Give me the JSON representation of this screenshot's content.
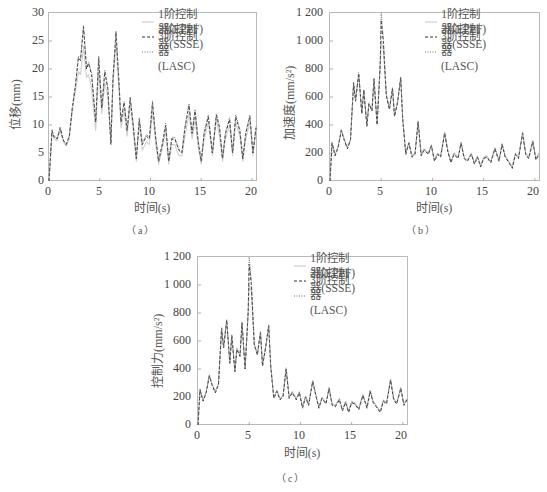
{
  "legend": [
    {
      "label": "1阶控制器(EPPF)",
      "style": "solid",
      "color": "#cfcfcf"
    },
    {
      "label": "3阶控制器(SSSE)",
      "style": "dashed",
      "color": "#333333"
    },
    {
      "label": "3阶控制器(LASC)",
      "style": "dotted",
      "color": "#777777"
    }
  ],
  "panels": {
    "a": {
      "caption": "（a）",
      "ylabel": "位移(mm)",
      "xlabel": "时间(s)",
      "yticks": [
        "0",
        "5",
        "10",
        "15",
        "20",
        "25",
        "30"
      ],
      "xticks": [
        "0",
        "5",
        "10",
        "15",
        "20"
      ]
    },
    "b": {
      "caption": "（b）",
      "ylabel": "加速度(mm/s²)",
      "xlabel": "时间(s)",
      "yticks": [
        "0",
        "200",
        "400",
        "600",
        "800",
        "1 000",
        "1 200"
      ],
      "xticks": [
        "0",
        "5",
        "10",
        "15",
        "20"
      ]
    },
    "c": {
      "caption": "（c）",
      "ylabel": "控制力(mm/s²)",
      "xlabel": "时间(s)",
      "yticks": [
        "0",
        "200",
        "400",
        "600",
        "800",
        "1 000",
        "1 200"
      ],
      "xticks": [
        "0",
        "5",
        "10",
        "15",
        "20"
      ]
    }
  },
  "chart_data": [
    {
      "type": "line",
      "title": "(a)",
      "xlabel": "时间(s)",
      "ylabel": "位移(mm)",
      "xlim": [
        0,
        20.5
      ],
      "ylim": [
        0,
        30
      ],
      "grid": false,
      "legend_position": "upper right",
      "x": [
        0,
        0.3,
        0.5,
        0.8,
        1.1,
        1.4,
        1.7,
        2.0,
        2.3,
        2.6,
        2.9,
        3.1,
        3.4,
        3.7,
        3.9,
        4.2,
        4.6,
        4.9,
        5.2,
        5.5,
        5.8,
        6.1,
        6.3,
        6.6,
        6.9,
        7.1,
        7.4,
        7.7,
        8.0,
        8.3,
        8.6,
        8.9,
        9.2,
        9.6,
        9.9,
        10.2,
        10.5,
        10.8,
        11.2,
        11.5,
        11.8,
        12.1,
        12.4,
        12.8,
        13.1,
        13.4,
        13.8,
        14.1,
        14.4,
        14.7,
        15.0,
        15.3,
        15.7,
        16.1,
        16.5,
        16.8,
        17.1,
        17.4,
        17.8,
        18.1,
        18.4,
        18.8,
        19.1,
        19.4,
        19.8,
        20.1,
        20.4
      ],
      "series": [
        {
          "name": "1阶控制器(EPPF)",
          "values": [
            0,
            8.5,
            7.5,
            7.2,
            9.0,
            7.0,
            6.2,
            7.5,
            12.5,
            16.0,
            19.5,
            19.0,
            24.0,
            18.5,
            19.0,
            16.5,
            9.0,
            19.5,
            12.0,
            17.5,
            15.0,
            7.0,
            17.0,
            24.5,
            16.0,
            9.5,
            12.5,
            8.0,
            13.5,
            9.0,
            3.5,
            10.0,
            5.5,
            7.0,
            6.5,
            12.5,
            7.0,
            3.0,
            6.0,
            9.0,
            3.0,
            6.5,
            6.5,
            4.5,
            4.5,
            8.0,
            12.0,
            7.5,
            11.0,
            6.0,
            3.0,
            7.5,
            10.5,
            4.5,
            11.0,
            8.0,
            3.5,
            7.5,
            10.0,
            4.5,
            10.5,
            8.0,
            3.5,
            7.5,
            10.5,
            4.5,
            9.0
          ]
        },
        {
          "name": "3阶控制器(SSSE)",
          "values": [
            0,
            9.0,
            7.8,
            7.5,
            9.5,
            7.3,
            6.5,
            8.0,
            13.0,
            17.0,
            22.0,
            21.5,
            27.5,
            20.0,
            21.0,
            19.0,
            10.5,
            22.0,
            13.0,
            19.5,
            16.5,
            6.5,
            18.0,
            26.5,
            17.5,
            10.5,
            14.0,
            9.0,
            14.8,
            10.0,
            4.0,
            11.0,
            6.5,
            8.0,
            7.5,
            14.0,
            8.0,
            3.5,
            6.8,
            10.0,
            3.5,
            7.5,
            7.5,
            5.5,
            5.0,
            9.5,
            13.5,
            8.5,
            12.5,
            7.0,
            3.5,
            8.5,
            11.5,
            5.0,
            11.8,
            9.5,
            4.0,
            8.5,
            11.0,
            5.0,
            11.5,
            9.0,
            4.0,
            8.5,
            11.5,
            5.0,
            9.5
          ]
        },
        {
          "name": "3阶控制器(LASC)",
          "values": [
            0,
            9.2,
            8.0,
            7.7,
            9.6,
            7.5,
            6.6,
            8.2,
            13.2,
            17.2,
            22.3,
            21.8,
            27.8,
            20.5,
            21.2,
            19.3,
            10.8,
            22.3,
            13.3,
            19.8,
            16.8,
            6.7,
            18.3,
            26.8,
            17.8,
            10.8,
            14.2,
            9.2,
            15.0,
            10.3,
            4.2,
            11.3,
            6.8,
            8.3,
            7.8,
            14.3,
            8.3,
            3.7,
            7.0,
            10.3,
            3.7,
            7.8,
            7.8,
            5.7,
            5.2,
            9.8,
            13.8,
            8.8,
            12.8,
            7.3,
            3.7,
            8.8,
            11.8,
            5.2,
            12.0,
            9.8,
            4.2,
            8.8,
            11.3,
            5.2,
            11.8,
            9.3,
            4.2,
            8.8,
            11.8,
            5.2,
            9.7
          ]
        }
      ]
    },
    {
      "type": "line",
      "title": "(b)",
      "xlabel": "时间(s)",
      "ylabel": "加速度(mm/s²)",
      "xlim": [
        0,
        20.5
      ],
      "ylim": [
        0,
        1200
      ],
      "grid": false,
      "legend_position": "upper right",
      "x": [
        0,
        0.2,
        0.5,
        0.8,
        1.1,
        1.4,
        1.7,
        2.0,
        2.3,
        2.5,
        2.8,
        3.1,
        3.3,
        3.6,
        3.8,
        4.1,
        4.3,
        4.6,
        4.9,
        5.0,
        5.2,
        5.5,
        5.8,
        6.1,
        6.3,
        6.6,
        6.9,
        7.1,
        7.4,
        7.7,
        8.0,
        8.3,
        8.6,
        8.9,
        9.2,
        9.6,
        9.9,
        10.2,
        10.5,
        10.8,
        11.2,
        11.5,
        11.8,
        12.1,
        12.5,
        12.8,
        13.1,
        13.4,
        13.8,
        14.1,
        14.4,
        14.7,
        15.0,
        15.3,
        15.7,
        16.1,
        16.5,
        16.8,
        17.1,
        17.4,
        17.8,
        18.1,
        18.4,
        18.8,
        19.1,
        19.4,
        19.8,
        20.1,
        20.4
      ],
      "series": [
        {
          "name": "1阶控制器(EPPF)",
          "values": [
            0,
            280,
            190,
            250,
            370,
            300,
            240,
            300,
            690,
            580,
            760,
            490,
            640,
            400,
            560,
            510,
            720,
            410,
            820,
            1000,
            940,
            620,
            520,
            670,
            470,
            570,
            730,
            450,
            200,
            280,
            180,
            200,
            430,
            190,
            230,
            200,
            260,
            150,
            200,
            180,
            350,
            220,
            140,
            200,
            170,
            280,
            170,
            150,
            200,
            130,
            180,
            110,
            170,
            180,
            140,
            240,
            150,
            270,
            180,
            150,
            100,
            200,
            170,
            350,
            200,
            170,
            290,
            160,
            200
          ]
        },
        {
          "name": "3阶控制器(SSSE)",
          "values": [
            0,
            270,
            180,
            240,
            360,
            290,
            230,
            290,
            700,
            570,
            770,
            480,
            650,
            390,
            550,
            500,
            730,
            400,
            830,
            1150,
            1000,
            610,
            510,
            660,
            460,
            560,
            740,
            440,
            190,
            270,
            170,
            190,
            420,
            180,
            220,
            190,
            250,
            140,
            190,
            170,
            340,
            210,
            130,
            190,
            160,
            270,
            160,
            140,
            190,
            120,
            170,
            100,
            160,
            170,
            130,
            230,
            140,
            260,
            170,
            140,
            90,
            190,
            160,
            340,
            190,
            160,
            280,
            150,
            190
          ]
        },
        {
          "name": "3阶控制器(LASC)",
          "values": [
            0,
            275,
            185,
            245,
            365,
            295,
            235,
            295,
            705,
            575,
            775,
            485,
            655,
            395,
            555,
            505,
            735,
            405,
            835,
            1200,
            1020,
            615,
            515,
            665,
            465,
            565,
            745,
            445,
            195,
            275,
            175,
            195,
            425,
            185,
            225,
            195,
            255,
            145,
            195,
            175,
            345,
            215,
            135,
            195,
            165,
            275,
            165,
            145,
            195,
            125,
            175,
            105,
            165,
            175,
            135,
            235,
            145,
            265,
            175,
            145,
            95,
            195,
            165,
            345,
            195,
            165,
            285,
            155,
            195
          ]
        }
      ]
    },
    {
      "type": "line",
      "title": "(c)",
      "xlabel": "时间(s)",
      "ylabel": "控制力(mm/s²)",
      "xlim": [
        0,
        20.5
      ],
      "ylim": [
        0,
        1200
      ],
      "grid": false,
      "legend_position": "upper right",
      "x": [
        0,
        0.2,
        0.5,
        0.8,
        1.1,
        1.4,
        1.7,
        2.0,
        2.3,
        2.5,
        2.8,
        3.1,
        3.3,
        3.6,
        3.8,
        4.1,
        4.3,
        4.6,
        4.9,
        5.0,
        5.2,
        5.5,
        5.8,
        6.1,
        6.3,
        6.6,
        6.9,
        7.1,
        7.4,
        7.7,
        8.0,
        8.3,
        8.6,
        8.9,
        9.2,
        9.6,
        9.9,
        10.2,
        10.5,
        10.8,
        11.2,
        11.5,
        11.8,
        12.1,
        12.5,
        12.8,
        13.1,
        13.4,
        13.8,
        14.1,
        14.4,
        14.7,
        15.0,
        15.3,
        15.7,
        16.1,
        16.5,
        16.8,
        17.1,
        17.4,
        17.8,
        18.1,
        18.4,
        18.8,
        19.1,
        19.4,
        19.8,
        20.1,
        20.4
      ],
      "series": [
        {
          "name": "1阶控制器(EPPF)",
          "values": [
            0,
            260,
            180,
            240,
            360,
            290,
            240,
            300,
            680,
            560,
            740,
            450,
            630,
            390,
            550,
            500,
            720,
            410,
            800,
            1000,
            950,
            580,
            510,
            670,
            430,
            560,
            700,
            430,
            200,
            250,
            190,
            210,
            410,
            200,
            240,
            190,
            240,
            130,
            210,
            150,
            320,
            220,
            130,
            200,
            160,
            270,
            150,
            140,
            190,
            110,
            170,
            100,
            170,
            160,
            120,
            220,
            130,
            250,
            170,
            140,
            100,
            180,
            160,
            330,
            190,
            160,
            270,
            150,
            190
          ]
        },
        {
          "name": "3阶控制器(SSSE)",
          "values": [
            0,
            250,
            170,
            230,
            350,
            280,
            230,
            290,
            690,
            550,
            750,
            440,
            640,
            380,
            540,
            490,
            730,
            400,
            810,
            1150,
            1010,
            570,
            500,
            660,
            420,
            550,
            710,
            420,
            190,
            240,
            180,
            200,
            400,
            190,
            230,
            180,
            230,
            120,
            200,
            140,
            310,
            210,
            120,
            190,
            150,
            260,
            140,
            130,
            180,
            100,
            160,
            90,
            160,
            150,
            110,
            210,
            120,
            240,
            160,
            130,
            90,
            170,
            150,
            320,
            180,
            150,
            260,
            140,
            180
          ]
        },
        {
          "name": "3阶控制器(LASC)",
          "values": [
            0,
            255,
            175,
            235,
            355,
            285,
            235,
            295,
            695,
            555,
            755,
            445,
            645,
            385,
            545,
            495,
            735,
            405,
            815,
            1200,
            1030,
            575,
            505,
            665,
            425,
            555,
            715,
            425,
            195,
            245,
            185,
            205,
            405,
            195,
            235,
            185,
            235,
            125,
            205,
            145,
            315,
            215,
            125,
            195,
            155,
            265,
            145,
            135,
            185,
            105,
            165,
            95,
            165,
            155,
            115,
            215,
            125,
            245,
            165,
            135,
            95,
            175,
            155,
            325,
            185,
            155,
            265,
            145,
            185
          ]
        }
      ]
    }
  ]
}
